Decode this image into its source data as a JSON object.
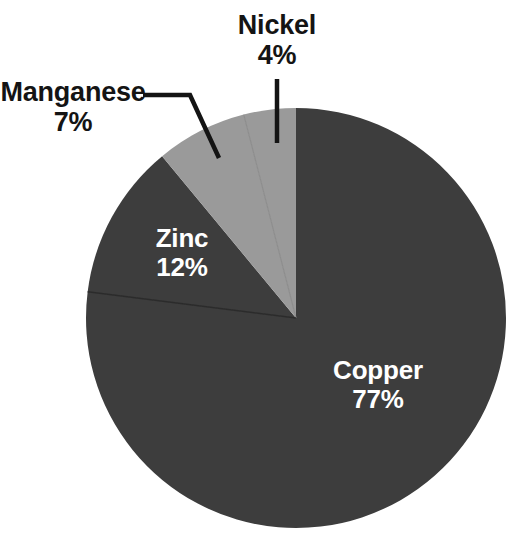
{
  "chart_data": {
    "type": "pie",
    "title": "",
    "subtitle": "",
    "xlabel": "",
    "ylabel": "",
    "legend_position": "none",
    "grid": false,
    "units": "percent",
    "total": 100,
    "start_angle_deg": 0,
    "direction": "clockwise",
    "categories": [
      "Copper",
      "Zinc",
      "Manganese",
      "Nickel"
    ],
    "values": [
      77,
      12,
      7,
      4
    ],
    "slices": [
      {
        "name": "Copper",
        "value": 77,
        "value_label": "77%",
        "color": "#3d3d3d",
        "label_placement": "inside",
        "text_color": "#ffffff",
        "start_angle_deg": 0,
        "end_angle_deg": 277.2
      },
      {
        "name": "Zinc",
        "value": 12,
        "value_label": "12%",
        "color": "#3d3d3d",
        "label_placement": "inside",
        "text_color": "#ffffff",
        "start_angle_deg": 277.2,
        "end_angle_deg": 320.4
      },
      {
        "name": "Manganese",
        "value": 7,
        "value_label": "7%",
        "color": "#9a9a9a",
        "label_placement": "outside",
        "text_color": "#141414",
        "start_angle_deg": 320.4,
        "end_angle_deg": 345.6
      },
      {
        "name": "Nickel",
        "value": 4,
        "value_label": "4%",
        "color": "#9a9a9a",
        "label_placement": "outside",
        "text_color": "#141414",
        "start_angle_deg": 345.6,
        "end_angle_deg": 360
      }
    ],
    "colors": {
      "dark_slice": "#3d3d3d",
      "light_slice": "#9a9a9a",
      "background": "#ffffff",
      "leader_line": "#141414",
      "divider": "#2b2b2b"
    },
    "geometry": {
      "center_x": 296,
      "center_y": 318,
      "radius": 210
    }
  },
  "labels": {
    "copper": {
      "name": "Copper",
      "value": "77%"
    },
    "zinc": {
      "name": "Zinc",
      "value": "12%"
    },
    "manganese": {
      "name": "Manganese",
      "value": "7%"
    },
    "nickel": {
      "name": "Nickel",
      "value": "4%"
    }
  }
}
